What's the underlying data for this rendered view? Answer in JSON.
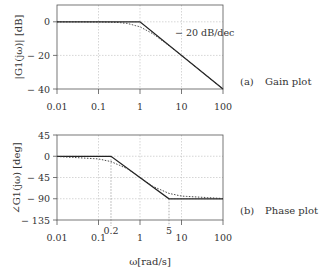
{
  "chart_data": [
    {
      "type": "line",
      "title": "(a) Gain plot",
      "caption_letter": "(a)",
      "caption_text": "Gain plot",
      "xlabel": "",
      "ylabel": "|G1(jω)| [dB]",
      "xscale": "log",
      "xlim": [
        0.01,
        100
      ],
      "ylim": [
        -40,
        10
      ],
      "xticks": [
        0.01,
        0.1,
        1,
        10,
        100
      ],
      "xtick_labels": [
        "0.01",
        "0.1",
        "1",
        "10",
        "100"
      ],
      "yticks": [
        0,
        -20,
        -40
      ],
      "ytick_labels": [
        "0",
        "− 20",
        "− 40"
      ],
      "grid": true,
      "annotation": "− 20 dB/dec",
      "series": [
        {
          "name": "asymptote",
          "style": "solid",
          "x": [
            0.01,
            1,
            100
          ],
          "y": [
            0,
            0,
            -40
          ]
        },
        {
          "name": "exact",
          "style": "dotted",
          "x": [
            0.01,
            0.1,
            0.3,
            0.5,
            1,
            2,
            5,
            10,
            100
          ],
          "y": [
            0,
            -0.04,
            -0.4,
            -1.0,
            -3.0,
            -7.0,
            -14.2,
            -20.0,
            -40.0
          ]
        }
      ]
    },
    {
      "type": "line",
      "title": "(b) Phase plot",
      "caption_letter": "(b)",
      "caption_text": "Phase plot",
      "xlabel": "ω[rad/s]",
      "ylabel": "∠G1(jω) [deg]",
      "xscale": "log",
      "xlim": [
        0.01,
        100
      ],
      "ylim": [
        -135,
        45
      ],
      "xticks": [
        0.01,
        0.1,
        0.2,
        1,
        5,
        10,
        100
      ],
      "xtick_labels": [
        "0.01",
        "0.1",
        "0.2",
        "1",
        "5",
        "10",
        "100"
      ],
      "yticks": [
        45,
        0,
        -45,
        -90,
        -135
      ],
      "ytick_labels": [
        "45",
        "0",
        "− 45",
        "− 90",
        "− 135"
      ],
      "grid": true,
      "series": [
        {
          "name": "asymptote",
          "style": "solid",
          "x": [
            0.01,
            0.2,
            5,
            100
          ],
          "y": [
            0,
            0,
            -90,
            -90
          ]
        },
        {
          "name": "exact",
          "style": "dotted",
          "x": [
            0.01,
            0.1,
            0.2,
            0.5,
            1,
            2,
            5,
            10,
            100
          ],
          "y": [
            -0.6,
            -5.7,
            -11.3,
            -26.6,
            -45,
            -63.4,
            -78.7,
            -84.3,
            -89.4
          ]
        }
      ]
    }
  ]
}
